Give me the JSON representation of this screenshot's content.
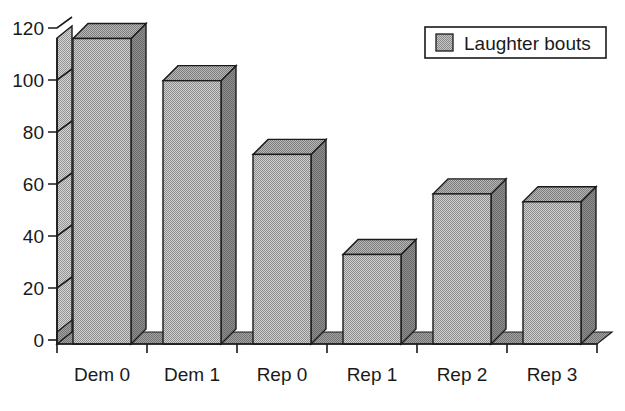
{
  "chart_data": {
    "type": "bar",
    "title": "",
    "subtitle": "",
    "xlabel": "",
    "ylabel": "",
    "categories": [
      "Dem 0",
      "Dem 1",
      "Rep 0",
      "Rep 1",
      "Rep 2",
      "Rep 3"
    ],
    "values": [
      116,
      100,
      72,
      34,
      57,
      54
    ],
    "series": [
      {
        "name": "Laughter bouts",
        "values": [
          116,
          100,
          72,
          34,
          57,
          54
        ]
      }
    ],
    "ylim": [
      0,
      120
    ],
    "yticks": [
      0,
      20,
      40,
      60,
      80,
      100,
      120
    ],
    "ytick_labels": [
      "0",
      "20",
      "40",
      "60",
      "80",
      "100",
      "120"
    ],
    "grid": false,
    "style": "3d-bar",
    "legend": {
      "position": "top-right",
      "entries": [
        {
          "label": "Laughter bouts",
          "swatch_color": "#a8a8a8"
        }
      ]
    },
    "colors": {
      "bar_front": "#a9a9a9",
      "bar_side": "#7d7d7d",
      "bar_top": "#bfbfbf",
      "axis_wall": "#b5b5b5",
      "floor": "#9a9a9a",
      "outline": "#1a1a1a",
      "background": "#ffffff",
      "text": "#1a1a1a"
    }
  },
  "legend_box": {
    "label": "Laughter bouts"
  },
  "axis": {
    "y_tick_0": "0",
    "y_tick_1": "20",
    "y_tick_2": "40",
    "y_tick_3": "60",
    "y_tick_4": "80",
    "y_tick_5": "100",
    "y_tick_6": "120",
    "x_cat_0": "Dem 0",
    "x_cat_1": "Dem 1",
    "x_cat_2": "Rep 0",
    "x_cat_3": "Rep 1",
    "x_cat_4": "Rep 2",
    "x_cat_5": "Rep 3"
  }
}
